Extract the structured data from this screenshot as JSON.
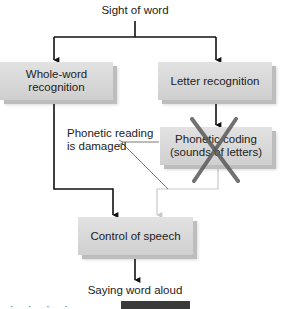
{
  "diagram": {
    "type": "flowchart",
    "title_node": {
      "label": "Sight of word"
    },
    "nodes": [
      {
        "id": "whole_word",
        "label": "Whole-word recognition"
      },
      {
        "id": "letter_rec",
        "label": "Letter recognition"
      },
      {
        "id": "phonetic_coding",
        "label_line1": "Phonetic coding",
        "label_line2": "(sounds of letters)",
        "status": "damaged (crossed out)"
      },
      {
        "id": "control_speech",
        "label": "Control of speech"
      }
    ],
    "output_node": {
      "label": "Saying word aloud"
    },
    "annotation": {
      "line1": "Phonetic reading",
      "line2": "is damaged"
    },
    "edges": [
      {
        "from": "Sight of word",
        "to": "whole_word",
        "style": "solid-black"
      },
      {
        "from": "Sight of word",
        "to": "letter_rec",
        "style": "solid-black"
      },
      {
        "from": "letter_rec",
        "to": "phonetic_coding",
        "style": "solid-black"
      },
      {
        "from": "whole_word",
        "to": "control_speech",
        "style": "solid-black"
      },
      {
        "from": "phonetic_coding",
        "to": "control_speech",
        "style": "faded-gray"
      },
      {
        "from": "control_speech",
        "to": "Saying word aloud",
        "style": "solid-black"
      }
    ],
    "colors": {
      "box_fill": "#d8d8d8",
      "line": "#111111",
      "faded_line": "#c8c8c8",
      "cross": "#555555",
      "bottom_bar": "#3a3a3a"
    },
    "bottom_cutoff_fragment": "· ·  ·  ·"
  }
}
